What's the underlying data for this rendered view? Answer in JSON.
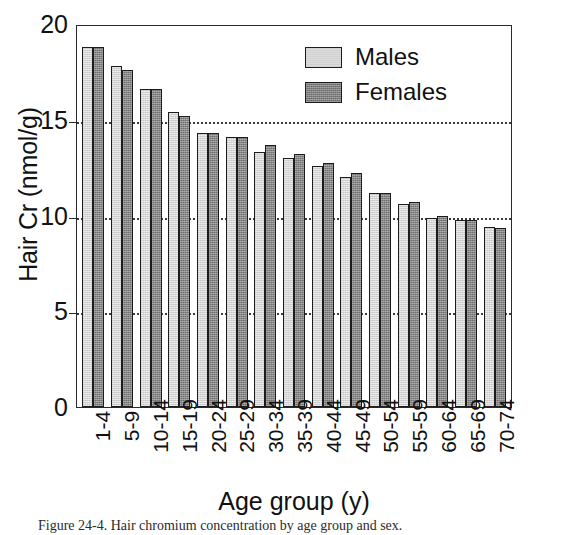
{
  "chart_data": {
    "type": "bar",
    "title": "",
    "xlabel": "Age group (y)",
    "ylabel": "Hair Cr (nmol/g)",
    "ylim": [
      0,
      20
    ],
    "yticks": [
      20,
      15,
      10,
      5,
      0
    ],
    "gridlines": [
      15,
      10,
      5
    ],
    "grid": "horizontal dotted at 5, 10, 15",
    "legend_position": "top-right inside plot area",
    "categories": [
      "1-4",
      "5-9",
      "10-14",
      "15-19",
      "20-24",
      "25-29",
      "30-34",
      "35-39",
      "40-44",
      "45-49",
      "50-54",
      "55-59",
      "60-64",
      "65-69",
      "70-74"
    ],
    "series": [
      {
        "name": "Males",
        "color": "#d4d4d4",
        "values": [
          18.8,
          17.8,
          16.6,
          15.4,
          14.3,
          14.1,
          13.3,
          13.0,
          12.6,
          12.0,
          11.2,
          10.6,
          9.85,
          9.75,
          9.4
        ]
      },
      {
        "name": "Females",
        "color": "#6f6f6f",
        "values": [
          18.8,
          17.6,
          16.6,
          15.2,
          14.3,
          14.1,
          13.7,
          13.2,
          12.75,
          12.2,
          11.2,
          10.7,
          10.0,
          9.75,
          9.35
        ]
      }
    ]
  },
  "legend": {
    "items": [
      {
        "label": "Males",
        "swatch": "male"
      },
      {
        "label": "Females",
        "swatch": "female"
      }
    ]
  },
  "caption": "Figure 24-4.  Hair chromium concentration by age group and sex."
}
